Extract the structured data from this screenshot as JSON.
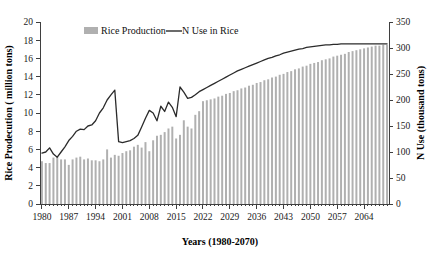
{
  "chart_data": {
    "type": "bar",
    "title": "",
    "xlabel": "Years (1980-2070)",
    "ylabel": "Rice Prodecution ( million tons)",
    "y2label": "N Use (thousand tons)",
    "grid": false,
    "legend_position": "top-center",
    "ylim": [
      0,
      20
    ],
    "y2lim": [
      0,
      350
    ],
    "xlim": [
      1980,
      2070
    ],
    "yticks": [
      0,
      2,
      4,
      6,
      8,
      10,
      12,
      14,
      16,
      18,
      20
    ],
    "y2ticks": [
      0,
      50,
      100,
      150,
      200,
      250,
      300,
      350
    ],
    "xticks": [
      1980,
      1987,
      1994,
      2001,
      2008,
      2015,
      2022,
      2029,
      2036,
      2043,
      2050,
      2057,
      2064
    ],
    "legend": [
      {
        "label": "Rice Production",
        "marker": "bar",
        "color": "#b0b0b0"
      },
      {
        "label": "N Use in Rice",
        "marker": "line",
        "color": "#2b2b2b"
      }
    ],
    "categories": [
      1980,
      1981,
      1982,
      1983,
      1984,
      1985,
      1986,
      1987,
      1988,
      1989,
      1990,
      1991,
      1992,
      1993,
      1994,
      1995,
      1996,
      1997,
      1998,
      1999,
      2000,
      2001,
      2002,
      2003,
      2004,
      2005,
      2006,
      2007,
      2008,
      2009,
      2010,
      2011,
      2012,
      2013,
      2014,
      2015,
      2016,
      2017,
      2018,
      2019,
      2020,
      2021,
      2022,
      2023,
      2024,
      2025,
      2026,
      2027,
      2028,
      2029,
      2030,
      2031,
      2032,
      2033,
      2034,
      2035,
      2036,
      2037,
      2038,
      2039,
      2040,
      2041,
      2042,
      2043,
      2044,
      2045,
      2046,
      2047,
      2048,
      2049,
      2050,
      2051,
      2052,
      2053,
      2054,
      2055,
      2056,
      2057,
      2058,
      2059,
      2060,
      2061,
      2062,
      2063,
      2064,
      2065,
      2066,
      2067,
      2068,
      2069,
      2070
    ],
    "series": [
      {
        "name": "Rice Production",
        "axis": "left",
        "unit": "million tons",
        "type": "bar",
        "values": [
          4.7,
          4.5,
          4.5,
          5.1,
          5.2,
          4.9,
          4.9,
          4.3,
          4.9,
          5.1,
          5.2,
          4.9,
          5.0,
          4.8,
          4.8,
          4.7,
          4.9,
          6.0,
          5.1,
          5.4,
          5.3,
          5.6,
          5.8,
          5.9,
          6.3,
          6.5,
          6.2,
          6.8,
          5.8,
          7.0,
          7.5,
          7.6,
          7.9,
          8.3,
          8.5,
          7.2,
          7.6,
          9.2,
          8.5,
          8.3,
          9.8,
          10.2,
          11.3,
          11.4,
          11.5,
          11.6,
          11.8,
          11.9,
          12.1,
          12.2,
          12.4,
          12.5,
          12.7,
          12.8,
          13.0,
          13.1,
          13.3,
          13.4,
          13.6,
          13.7,
          13.9,
          14.0,
          14.2,
          14.3,
          14.5,
          14.6,
          14.8,
          14.9,
          15.1,
          15.2,
          15.4,
          15.5,
          15.6,
          15.8,
          15.9,
          16.0,
          16.2,
          16.3,
          16.4,
          16.5,
          16.7,
          16.8,
          16.9,
          17.0,
          17.1,
          17.2,
          17.3,
          17.4,
          17.4,
          17.5,
          17.5
        ]
      },
      {
        "name": "N Use in Rice",
        "axis": "right",
        "unit": "thousand tons",
        "type": "line",
        "values": [
          98,
          100,
          108,
          96,
          90,
          100,
          110,
          122,
          130,
          140,
          144,
          143,
          150,
          152,
          160,
          175,
          185,
          200,
          210,
          219,
          120,
          118,
          120,
          122,
          126,
          132,
          148,
          165,
          180,
          175,
          160,
          188,
          178,
          196,
          186,
          168,
          225,
          215,
          203,
          205,
          210,
          216,
          220,
          224,
          228,
          232,
          236,
          240,
          244,
          248,
          252,
          256,
          259,
          262,
          265,
          268,
          271,
          274,
          277,
          280,
          282,
          285,
          287,
          290,
          292,
          294,
          296,
          298,
          299,
          301,
          302,
          303,
          304,
          305,
          306,
          306,
          307,
          307,
          308,
          308,
          308,
          308,
          308,
          308,
          308,
          308,
          308,
          308,
          308,
          308,
          308
        ]
      }
    ]
  }
}
